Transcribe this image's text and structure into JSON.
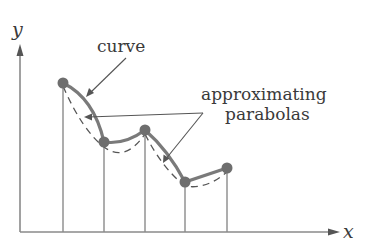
{
  "diagram": {
    "type": "piecewise parabolic approximation (Simpson's rule illustration)",
    "axes": {
      "x_label": "x",
      "y_label": "y"
    },
    "labels": {
      "curve": "curve",
      "approx_line1": "approximating",
      "approx_line2": "parabolas"
    },
    "points": [
      {
        "x": 63,
        "y": 83
      },
      {
        "x": 104,
        "y": 142
      },
      {
        "x": 145,
        "y": 130
      },
      {
        "x": 185,
        "y": 182
      },
      {
        "x": 227,
        "y": 168
      }
    ],
    "colors": {
      "curve": "#7a7a7a",
      "point": "#6e6e6e",
      "lines": "#8a8a8a",
      "text": "#3a3a3a",
      "background": "#ffffff"
    }
  }
}
